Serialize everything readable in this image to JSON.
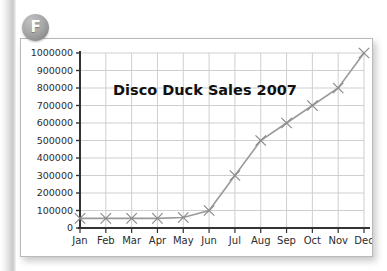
{
  "badge": {
    "label": "F",
    "color": "#a0a0a0"
  },
  "chart_data": {
    "type": "line",
    "title": "Disco Duck Sales 2007",
    "xlabel": "",
    "ylabel": "",
    "categories": [
      "Jan",
      "Feb",
      "Mar",
      "Apr",
      "May",
      "Jun",
      "Jul",
      "Aug",
      "Sep",
      "Oct",
      "Nov",
      "Dec"
    ],
    "values": [
      55000,
      55000,
      55000,
      55000,
      60000,
      100000,
      300000,
      500000,
      600000,
      700000,
      800000,
      1000000
    ],
    "series": [
      {
        "name": "Disco Duck Sales 2007",
        "values": [
          55000,
          55000,
          55000,
          55000,
          60000,
          100000,
          300000,
          500000,
          600000,
          700000,
          800000,
          1000000
        ]
      }
    ],
    "ylim": [
      0,
      1000000
    ],
    "ytick_values": [
      0,
      100000,
      200000,
      300000,
      400000,
      500000,
      600000,
      700000,
      800000,
      900000,
      1000000
    ],
    "ytick_labels": [
      "0",
      "100000",
      "200000",
      "300000",
      "400000",
      "500000",
      "600000",
      "700000",
      "800000",
      "900000",
      "1000000"
    ],
    "grid": true,
    "grid_color": "#cfcfcf",
    "legend": false,
    "legend_position": "none",
    "line_color": "#9a9a9a",
    "marker": "x",
    "marker_color": "#8a8a8a",
    "axis_color": "#333333"
  }
}
